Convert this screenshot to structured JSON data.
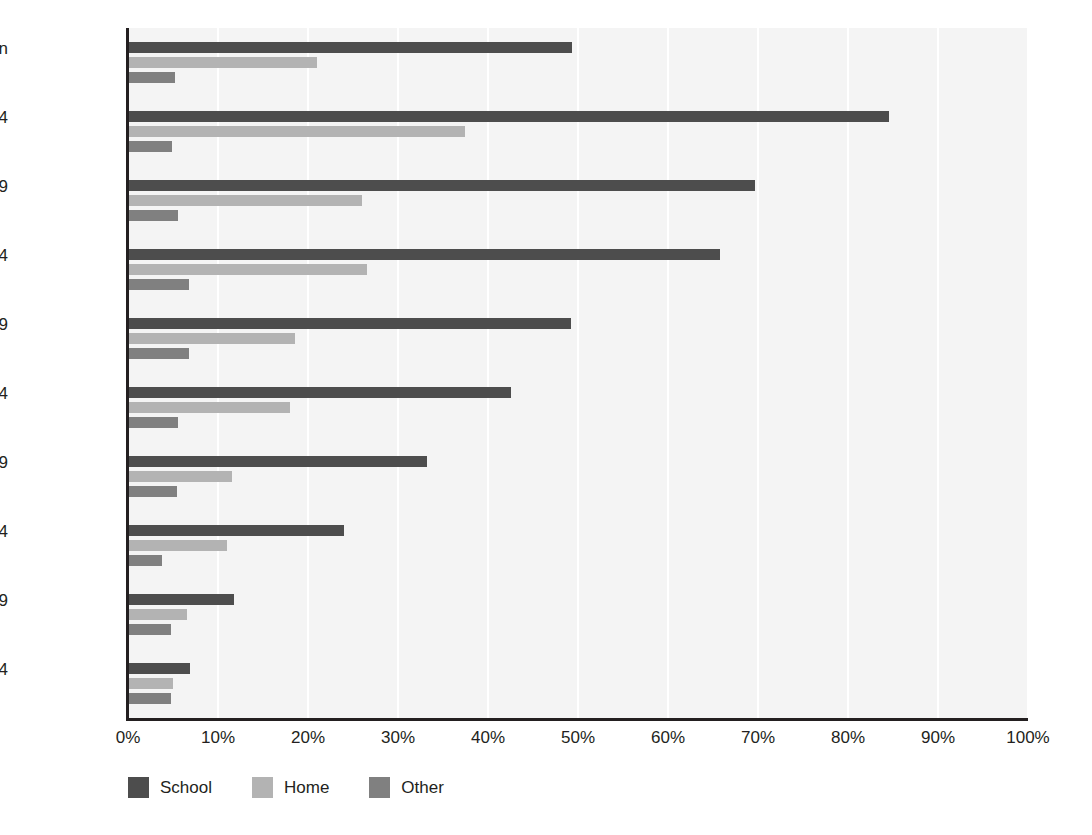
{
  "chart_data": {
    "type": "bar",
    "orientation": "horizontal",
    "title": "",
    "subtitle": "",
    "xlabel": "",
    "ylabel": "",
    "xlim": [
      0,
      100
    ],
    "xtick_labels": [
      "0%",
      "10%",
      "20%",
      "30%",
      "40%",
      "50%",
      "60%",
      "70%",
      "80%",
      "90%",
      "100%"
    ],
    "xticks": [
      0,
      10,
      20,
      30,
      40,
      50,
      60,
      70,
      80,
      90,
      100
    ],
    "grid": "vertical",
    "legend_position": "bottom-left",
    "categories": [
      "All women",
      "18-24",
      "25-29",
      "30-34",
      "35-39",
      "40-44",
      "45-49",
      "50-54",
      "55-59",
      "60-64"
    ],
    "series": [
      {
        "name": "School",
        "color": "#4d4d4d",
        "values": [
          49.3,
          84.5,
          69.7,
          65.8,
          49.2,
          42.5,
          33.2,
          24.0,
          11.8,
          6.9
        ]
      },
      {
        "name": "Home",
        "color": "#b3b3b3",
        "values": [
          21.0,
          37.4,
          26.0,
          26.5,
          18.6,
          18.0,
          11.5,
          11.0,
          6.5,
          5.0
        ]
      },
      {
        "name": "Other",
        "color": "#808080",
        "values": [
          5.2,
          4.9,
          5.5,
          6.8,
          6.8,
          5.5,
          5.4,
          3.8,
          4.8,
          4.8
        ]
      }
    ]
  },
  "legend": {
    "items": [
      {
        "label": "School",
        "color": "#4d4d4d"
      },
      {
        "label": "Home",
        "color": "#b3b3b3"
      },
      {
        "label": "Other",
        "color": "#808080"
      }
    ]
  }
}
